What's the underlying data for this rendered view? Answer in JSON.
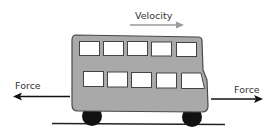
{
  "diagram": {
    "title": "",
    "labels": {
      "velocity": "Velocity",
      "force_left": "Force",
      "force_right": "Force"
    },
    "colors": {
      "bus_body": "#a9a9a9",
      "bus_outline": "#4a4a4a",
      "window_fill": "#ffffff",
      "wheel": "#111111",
      "ground": "#222222",
      "force_arrow": "#111111",
      "velocity_arrow": "#999999",
      "text": "#333333"
    },
    "bus": {
      "upper_windows": 5,
      "lower_windows": 5,
      "wheels": 2
    },
    "arrows": [
      {
        "name": "velocity",
        "direction": "right"
      },
      {
        "name": "force-left",
        "direction": "left"
      },
      {
        "name": "force-right",
        "direction": "right"
      }
    ]
  }
}
